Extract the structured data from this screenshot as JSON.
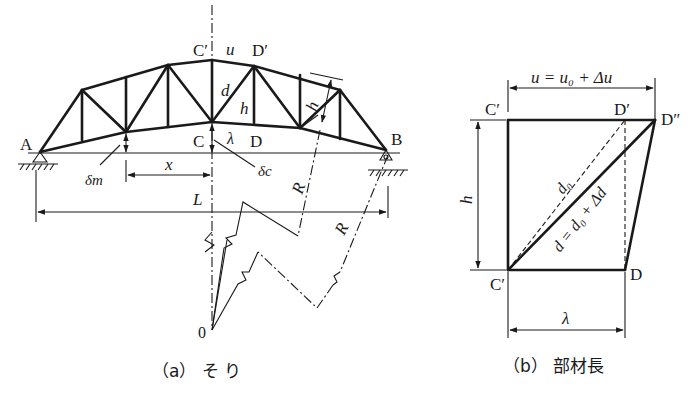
{
  "figure_a": {
    "caption": "（a） そ り",
    "labels": {
      "A": "A",
      "B": "B",
      "C": "C",
      "C_prime": "C′",
      "D": "D",
      "D_prime": "D′",
      "u": "u",
      "d": "d",
      "h_vert": "h",
      "h_side": "h",
      "lambda": "λ",
      "delta_m": "δm",
      "delta_c": "δc",
      "x": "x",
      "L": "L",
      "R1": "R",
      "R2": "R",
      "O": "0"
    }
  },
  "figure_b": {
    "caption": "（b） 部材長",
    "labels": {
      "u_eq": "u = u₀ + Δu",
      "C_prime_top": "C′",
      "D_prime": "D′",
      "D_double_prime": "D″",
      "h": "h",
      "d0": "d₀",
      "d_eq": "d = d₀ + Δd",
      "C_prime_bottom": "C′",
      "D": "D",
      "lambda": "λ"
    }
  }
}
